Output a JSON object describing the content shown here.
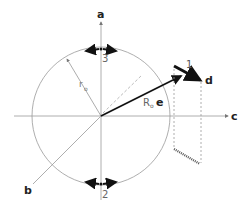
{
  "diagram": {
    "axes": {
      "a": "a",
      "b": "b",
      "c": "c"
    },
    "labels": {
      "radius": "r",
      "radius_sub": "o",
      "vector": "R",
      "vector_sub": "o",
      "vector_unit": "e",
      "point_d": "d",
      "segment_1": "1",
      "marker_2": "2",
      "marker_3": "3"
    },
    "colors": {
      "line": "#888888",
      "dark": "#111111",
      "text": "#222222"
    }
  }
}
